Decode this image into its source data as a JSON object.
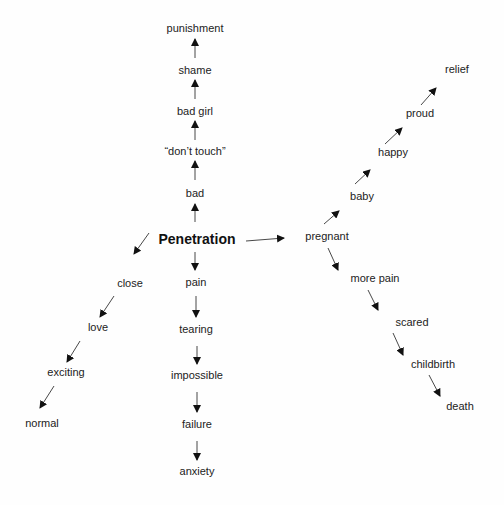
{
  "diagram": {
    "background": "#fefefe",
    "line_color": "#333333",
    "nodes": [
      {
        "id": "penetration",
        "label": "Penetration",
        "x": 197,
        "y": 239,
        "root": true
      },
      {
        "id": "bad",
        "label": "bad",
        "x": 195,
        "y": 193
      },
      {
        "id": "dont_touch",
        "label": "“don’t touch”",
        "x": 195,
        "y": 151
      },
      {
        "id": "bad_girl",
        "label": "bad girl",
        "x": 195,
        "y": 111
      },
      {
        "id": "shame",
        "label": "shame",
        "x": 195,
        "y": 70
      },
      {
        "id": "punishment",
        "label": "punishment",
        "x": 195,
        "y": 28
      },
      {
        "id": "pain",
        "label": "pain",
        "x": 196,
        "y": 282
      },
      {
        "id": "tearing",
        "label": "tearing",
        "x": 196,
        "y": 329
      },
      {
        "id": "impossible",
        "label": "impossible",
        "x": 197,
        "y": 375
      },
      {
        "id": "failure",
        "label": "failure",
        "x": 197,
        "y": 424
      },
      {
        "id": "anxiety",
        "label": "anxiety",
        "x": 197,
        "y": 471
      },
      {
        "id": "close",
        "label": "close",
        "x": 130,
        "y": 283
      },
      {
        "id": "love",
        "label": "love",
        "x": 98,
        "y": 327
      },
      {
        "id": "exciting",
        "label": "exciting",
        "x": 66,
        "y": 372
      },
      {
        "id": "normal",
        "label": "normal",
        "x": 42,
        "y": 423
      },
      {
        "id": "pregnant",
        "label": "pregnant",
        "x": 327,
        "y": 236
      },
      {
        "id": "baby",
        "label": "baby",
        "x": 362,
        "y": 196
      },
      {
        "id": "happy",
        "label": "happy",
        "x": 393,
        "y": 152
      },
      {
        "id": "proud",
        "label": "proud",
        "x": 420,
        "y": 113
      },
      {
        "id": "relief",
        "label": "relief",
        "x": 457,
        "y": 69
      },
      {
        "id": "more_pain",
        "label": "more pain",
        "x": 375,
        "y": 278
      },
      {
        "id": "scared",
        "label": "scared",
        "x": 412,
        "y": 322
      },
      {
        "id": "childbirth",
        "label": "childbirth",
        "x": 433,
        "y": 364
      },
      {
        "id": "death",
        "label": "death",
        "x": 460,
        "y": 406
      }
    ],
    "edges": [
      {
        "from": "penetration",
        "to": "bad",
        "x1": 195,
        "y1": 222,
        "x2": 195,
        "y2": 204
      },
      {
        "from": "bad",
        "to": "dont_touch",
        "x1": 195,
        "y1": 180,
        "x2": 195,
        "y2": 161
      },
      {
        "from": "dont_touch",
        "to": "bad_girl",
        "x1": 195,
        "y1": 140,
        "x2": 195,
        "y2": 121
      },
      {
        "from": "bad_girl",
        "to": "shame",
        "x1": 195,
        "y1": 99,
        "x2": 195,
        "y2": 80
      },
      {
        "from": "shame",
        "to": "punishment",
        "x1": 195,
        "y1": 58,
        "x2": 195,
        "y2": 39
      },
      {
        "from": "penetration",
        "to": "pain",
        "x1": 195,
        "y1": 252,
        "x2": 195,
        "y2": 270
      },
      {
        "from": "pain",
        "to": "tearing",
        "x1": 196,
        "y1": 296,
        "x2": 196,
        "y2": 317
      },
      {
        "from": "tearing",
        "to": "impossible",
        "x1": 197,
        "y1": 346,
        "x2": 197,
        "y2": 364
      },
      {
        "from": "impossible",
        "to": "failure",
        "x1": 197,
        "y1": 392,
        "x2": 197,
        "y2": 412
      },
      {
        "from": "failure",
        "to": "anxiety",
        "x1": 197,
        "y1": 441,
        "x2": 197,
        "y2": 460
      },
      {
        "from": "penetration",
        "to": "close",
        "x1": 149,
        "y1": 233,
        "x2": 134,
        "y2": 254
      },
      {
        "from": "close",
        "to": "love",
        "x1": 114,
        "y1": 296,
        "x2": 100,
        "y2": 317
      },
      {
        "from": "love",
        "to": "exciting",
        "x1": 80,
        "y1": 341,
        "x2": 67,
        "y2": 362
      },
      {
        "from": "exciting",
        "to": "normal",
        "x1": 54,
        "y1": 386,
        "x2": 40,
        "y2": 408
      },
      {
        "from": "penetration",
        "to": "pregnant",
        "x1": 246,
        "y1": 241,
        "x2": 284,
        "y2": 238
      },
      {
        "from": "pregnant",
        "to": "baby",
        "x1": 324,
        "y1": 224,
        "x2": 339,
        "y2": 211
      },
      {
        "from": "baby",
        "to": "happy",
        "x1": 355,
        "y1": 184,
        "x2": 370,
        "y2": 170
      },
      {
        "from": "happy",
        "to": "proud",
        "x1": 385,
        "y1": 144,
        "x2": 402,
        "y2": 128
      },
      {
        "from": "proud",
        "to": "relief",
        "x1": 421,
        "y1": 105,
        "x2": 436,
        "y2": 88
      },
      {
        "from": "pregnant",
        "to": "more_pain",
        "x1": 328,
        "y1": 248,
        "x2": 338,
        "y2": 270
      },
      {
        "from": "more_pain",
        "to": "scared",
        "x1": 368,
        "y1": 290,
        "x2": 378,
        "y2": 310
      },
      {
        "from": "scared",
        "to": "childbirth",
        "x1": 393,
        "y1": 333,
        "x2": 403,
        "y2": 355
      },
      {
        "from": "childbirth",
        "to": "death",
        "x1": 429,
        "y1": 375,
        "x2": 440,
        "y2": 396
      }
    ]
  }
}
